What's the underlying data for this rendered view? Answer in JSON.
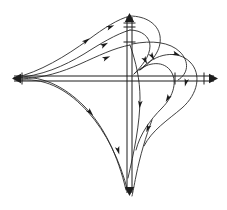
{
  "figure": {
    "title": "Phase portrait with double-ruled coordinate axes and directed trajectory curves",
    "caption": "",
    "background_color": "#ffffff",
    "line_color": "#1d1d1d",
    "curve_color": "#2a2a2a",
    "width": 227,
    "height": 210
  },
  "axes": {
    "horizontal": {
      "name": "horizontal-axis",
      "y_upper": 76,
      "y_lower": 81,
      "x_start": 12,
      "x_end": 218,
      "arrow_left": true,
      "arrow_right": true,
      "tick_count": 3
    },
    "vertical": {
      "name": "vertical-axis",
      "x_left": 127,
      "x_right": 132,
      "y_start": 13,
      "y_end": 196,
      "arrow_up": true,
      "arrow_down": true,
      "tick_count": 3
    },
    "origin": {
      "x": 129.5,
      "y": 78.5
    }
  },
  "chart_data": {
    "type": "line",
    "xlabel": "",
    "ylabel": "",
    "grid": false,
    "legend": null,
    "series": [
      {
        "name": "upper-left-outer-separatrix",
        "arrow_count": 2,
        "path": "M 14 78 C 40 72 66 56 88 40 C 104 28 118 19 130 16"
      },
      {
        "name": "upper-left-inner-curve",
        "arrow_count": 1,
        "path": "M 14 78 C 42 76 64 66 84 54 C 100 44 116 34 130 30"
      },
      {
        "name": "upper-left-low-arc",
        "arrow_count": 1,
        "path": "M 20 79 C 44 78 62 72 80 64 C 98 56 114 48 130 45"
      },
      {
        "name": "top-loop-right-return",
        "arrow_count": 1,
        "path": "M 130 16 C 146 16 158 24 160 36 C 162 50 152 62 140 70"
      },
      {
        "name": "top-loop-inner-return",
        "arrow_count": 1,
        "path": "M 130 30 C 142 30 150 37 150 46 C 150 56 142 66 134 74"
      },
      {
        "name": "right-upper-loop-outer",
        "arrow_count": 1,
        "path": "M 132 44 C 152 40 170 42 180 52 C 190 62 188 74 178 80"
      },
      {
        "name": "right-loop-large",
        "arrow_count": 1,
        "path": "M 140 70 C 156 52 178 50 190 62 C 202 74 198 94 182 108 C 168 120 152 130 144 146"
      },
      {
        "name": "right-loop-medium",
        "arrow_count": 1,
        "path": "M 134 74 C 146 62 162 60 170 70 C 178 80 174 96 162 108 C 150 120 140 134 136 150"
      },
      {
        "name": "center-descending-curve",
        "arrow_count": 1,
        "path": "M 130 45 C 136 62 140 80 140 98 C 140 124 134 152 128 178"
      },
      {
        "name": "long-sweep-left-to-bottom",
        "arrow_count": 1,
        "path": "M 14 78 C 40 74 64 86 84 106 C 104 126 118 156 126 190"
      },
      {
        "name": "long-sweep-secondary",
        "arrow_count": 1,
        "path": "M 22 80 C 48 78 70 92 88 112 C 106 132 120 160 128 192"
      },
      {
        "name": "bottom-right-branch",
        "arrow_count": 1,
        "path": "M 152 120 C 146 136 140 156 136 176 C 134 186 133 192 132 196"
      }
    ],
    "flow_arrows": [
      {
        "x": 86,
        "y": 41,
        "angle": -36
      },
      {
        "x": 110,
        "y": 27,
        "angle": -22
      },
      {
        "x": 104,
        "y": 45,
        "angle": -28
      },
      {
        "x": 106,
        "y": 58,
        "angle": -24
      },
      {
        "x": 152,
        "y": 56,
        "angle": 58
      },
      {
        "x": 145,
        "y": 60,
        "angle": 62
      },
      {
        "x": 176,
        "y": 54,
        "angle": 20
      },
      {
        "x": 186,
        "y": 82,
        "angle": 104
      },
      {
        "x": 168,
        "y": 98,
        "angle": 120
      },
      {
        "x": 140,
        "y": 104,
        "angle": 96
      },
      {
        "x": 148,
        "y": 128,
        "angle": 112
      },
      {
        "x": 90,
        "y": 112,
        "angle": 48
      },
      {
        "x": 118,
        "y": 150,
        "angle": 74
      }
    ]
  }
}
